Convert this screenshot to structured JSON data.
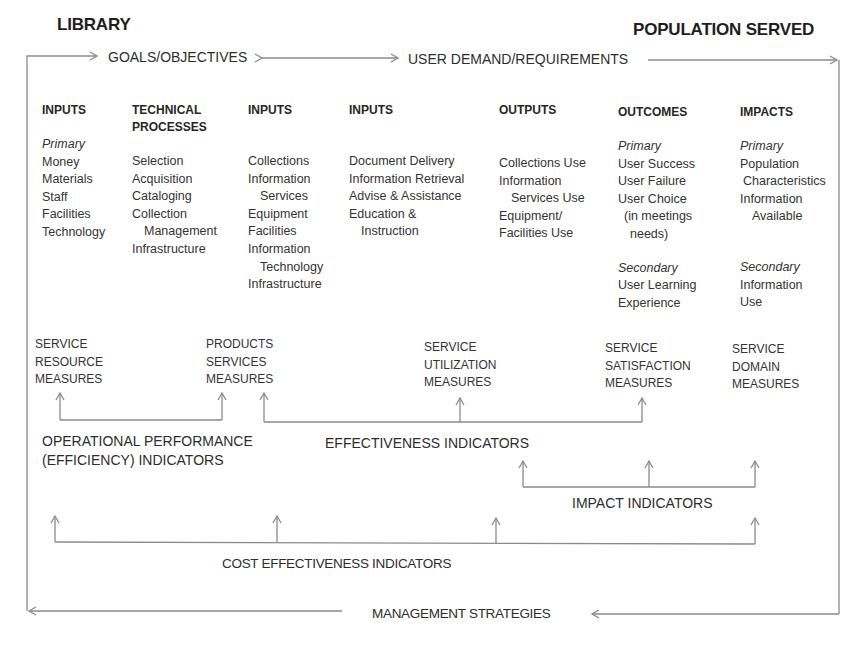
{
  "header": {
    "left_title": "LIBRARY",
    "right_title": "POPULATION SERVED"
  },
  "flow_top": {
    "goals": "GOALS/OBJECTIVES",
    "user_demand": "USER DEMAND/REQUIREMENTS"
  },
  "columns": [
    {
      "heading": [
        "INPUTS"
      ],
      "items": [
        {
          "text": "Primary",
          "style": "italic"
        },
        {
          "text": "Money"
        },
        {
          "text": "Materials"
        },
        {
          "text": "Staff"
        },
        {
          "text": "Facilities"
        },
        {
          "text": "Technology"
        }
      ]
    },
    {
      "heading": [
        "TECHNICAL",
        "PROCESSES"
      ],
      "items": [
        {
          "text": "Selection"
        },
        {
          "text": "Acquisition"
        },
        {
          "text": "Cataloging"
        },
        {
          "text": "Collection"
        },
        {
          "text": "Management",
          "indent": true
        },
        {
          "text": "Infrastructure"
        }
      ]
    },
    {
      "heading": [
        "INPUTS"
      ],
      "items": [
        {
          "text": "Collections"
        },
        {
          "text": "Information"
        },
        {
          "text": "Services",
          "indent": true
        },
        {
          "text": "Equipment"
        },
        {
          "text": "Facilities"
        },
        {
          "text": "Information"
        },
        {
          "text": "Technology",
          "indent": true
        },
        {
          "text": "Infrastructure"
        }
      ]
    },
    {
      "heading": [
        "INPUTS"
      ],
      "items": [
        {
          "text": "Document Delivery"
        },
        {
          "text": "Information Retrieval"
        },
        {
          "text": "Advise & Assistance"
        },
        {
          "text": "Education &"
        },
        {
          "text": "Instruction",
          "indent": true
        }
      ]
    },
    {
      "heading": [
        "OUTPUTS"
      ],
      "items": [
        {
          "text": "Collections Use"
        },
        {
          "text": "Information"
        },
        {
          "text": "Services Use",
          "indent": true
        },
        {
          "text": "Equipment/"
        },
        {
          "text": "Facilities Use"
        }
      ]
    },
    {
      "heading": [
        "OUTCOMES"
      ],
      "items": [
        {
          "text": "Primary",
          "style": "italic"
        },
        {
          "text": "User Success"
        },
        {
          "text": "User Failure"
        },
        {
          "text": "User Choice"
        },
        {
          "text": "(in meetings",
          "indent": true
        },
        {
          "text": "needs)",
          "indent": true
        },
        {
          "text": "Secondary",
          "style": "italic"
        },
        {
          "text": "User Learning"
        },
        {
          "text": "Experience"
        }
      ]
    },
    {
      "heading": [
        "IMPACTS"
      ],
      "items": [
        {
          "text": "Primary",
          "style": "italic"
        },
        {
          "text": "Population"
        },
        {
          "text": "Characteristics",
          "indent": true
        },
        {
          "text": "Information"
        },
        {
          "text": "Available",
          "indent": true
        },
        {
          "text": "Secondary",
          "style": "italic"
        },
        {
          "text": "Information"
        },
        {
          "text": "Use"
        }
      ]
    }
  ],
  "measures": [
    {
      "lines": [
        "SERVICE",
        "RESOURCE",
        "MEASURES"
      ]
    },
    {
      "lines": [
        "PRODUCTS",
        "SERVICES",
        "MEASURES"
      ]
    },
    {
      "lines": [
        "SERVICE",
        "UTILIZATION",
        "MEASURES"
      ]
    },
    {
      "lines": [
        "SERVICE",
        "SATISFACTION",
        "MEASURES"
      ]
    },
    {
      "lines": [
        "SERVICE",
        "DOMAIN",
        "MEASURES"
      ]
    }
  ],
  "indicators": {
    "operational": [
      "OPERATIONAL PERFORMANCE",
      "(EFFICIENCY) INDICATORS"
    ],
    "effectiveness": "EFFECTIVENESS INDICATORS",
    "impact": "IMPACT INDICATORS",
    "cost_effectiveness": "COST EFFECTIVENESS INDICATORS"
  },
  "flow_bottom": {
    "management": "MANAGEMENT STRATEGIES"
  },
  "colors": {
    "text": "#333333",
    "title": "#1e1e1e",
    "arrow": "#8a8a8a",
    "background": "#ffffff"
  }
}
